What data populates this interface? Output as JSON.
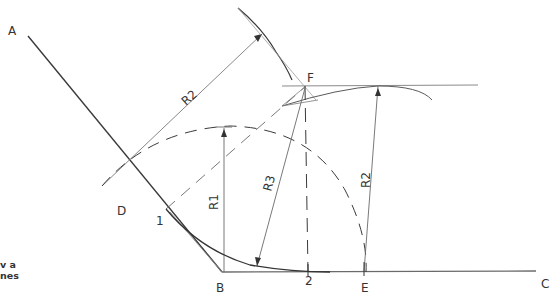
{
  "diagram": {
    "points": {
      "A": "A",
      "B": "B",
      "C": "C",
      "D": "D",
      "F": "F",
      "E": "E",
      "one": "1",
      "two": "2"
    },
    "radii": {
      "r1": "R1",
      "r2_upper": "R2",
      "r2_right": "R2",
      "r3": "R3"
    },
    "caption": {
      "line1": "v a",
      "line2": "nes"
    },
    "colors": {
      "line": "#3a3a3a",
      "light": "#8a8a8a"
    }
  }
}
